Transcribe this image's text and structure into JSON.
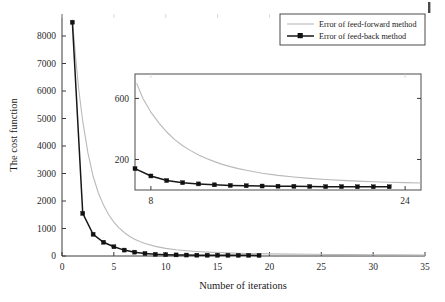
{
  "figure": {
    "background": "#ffffff",
    "artifact_mark": "page-scan-artifact"
  },
  "chart_data": {
    "type": "line",
    "title": "",
    "xlabel": "Number of iterations",
    "ylabel": "The cost function",
    "xlim": [
      0,
      35
    ],
    "ylim": [
      0,
      8800
    ],
    "xticks": [
      0,
      5,
      10,
      15,
      20,
      25,
      30,
      35
    ],
    "yticks": [
      0,
      1000,
      2000,
      3000,
      4000,
      5000,
      6000,
      7000,
      8000
    ],
    "grid": false,
    "legend_position": "top-right",
    "series": [
      {
        "name": "Error of feed-forward method",
        "color": "#b9b9b9",
        "marker": "none",
        "x": [
          1,
          1.3,
          1.6,
          2,
          2.5,
          3,
          3.5,
          4,
          4.5,
          5,
          5.5,
          6,
          6.5,
          7,
          7.5,
          8,
          9,
          10,
          11,
          12,
          13,
          14,
          15,
          16,
          17,
          18,
          20,
          22,
          24,
          26,
          28,
          30,
          32,
          35
        ],
        "y": [
          8600,
          7300,
          6100,
          4900,
          3750,
          2900,
          2300,
          1850,
          1500,
          1230,
          1020,
          855,
          720,
          610,
          525,
          455,
          350,
          278,
          228,
          192,
          164,
          142,
          125,
          112,
          101,
          92,
          78,
          68,
          61,
          55,
          50,
          46,
          43,
          39
        ]
      },
      {
        "name": "Error of feed-back method",
        "color": "#171717",
        "marker": "square",
        "x": [
          1,
          2,
          3,
          4,
          5,
          6,
          7,
          8,
          9,
          10,
          11,
          12,
          13,
          14,
          15,
          16,
          17,
          18,
          19
        ],
        "y": [
          8500,
          1550,
          790,
          500,
          335,
          215,
          140,
          92,
          62,
          48,
          40,
          34,
          30,
          28,
          26,
          25,
          24,
          23,
          22
        ]
      }
    ]
  },
  "inset_chart_data": {
    "type": "line",
    "title": "",
    "xlabel": "",
    "ylabel": "",
    "xlim": [
      7,
      25
    ],
    "ylim": [
      0,
      760
    ],
    "xticks": [
      8,
      24
    ],
    "yticks": [
      200,
      600
    ],
    "grid": false,
    "series": [
      {
        "name": "Error of feed-forward method",
        "color": "#b9b9b9",
        "marker": "none",
        "x": [
          7.1,
          7.5,
          8,
          8.5,
          9,
          9.5,
          10,
          10.5,
          11,
          11.5,
          12,
          12.5,
          13,
          13.5,
          14,
          15,
          16,
          17,
          18,
          19,
          20,
          21,
          22,
          23,
          24,
          25
        ],
        "y": [
          700,
          600,
          510,
          440,
          380,
          330,
          290,
          258,
          230,
          206,
          186,
          168,
          153,
          140,
          129,
          110,
          96,
          85,
          76,
          69,
          63,
          58,
          54,
          51,
          48,
          46
        ]
      },
      {
        "name": "Error of feed-back method",
        "color": "#171717",
        "marker": "square",
        "x": [
          7,
          8,
          9,
          10,
          11,
          12,
          13,
          14,
          15,
          16,
          17,
          18,
          19,
          20,
          21,
          22,
          23
        ],
        "y": [
          140,
          92,
          62,
          48,
          40,
          34,
          30,
          28,
          26,
          25,
          24,
          23,
          22,
          22,
          21,
          21,
          21
        ]
      }
    ]
  },
  "legend": {
    "entries": [
      {
        "label": "Error of feed-forward method",
        "color": "#b9b9b9",
        "marker": "none"
      },
      {
        "label": "Error of feed-back method",
        "color": "#171717",
        "marker": "square"
      }
    ]
  },
  "axis_labels": {
    "x_title": "Number of iterations",
    "y_title": "The cost function",
    "x_ticks": [
      "0",
      "5",
      "10",
      "15",
      "20",
      "25",
      "30",
      "35"
    ],
    "y_ticks": [
      "0",
      "1000",
      "2000",
      "3000",
      "4000",
      "5000",
      "6000",
      "7000",
      "8000"
    ],
    "inset_x_ticks": [
      "8",
      "24"
    ],
    "inset_y_ticks": [
      "200",
      "600"
    ]
  }
}
